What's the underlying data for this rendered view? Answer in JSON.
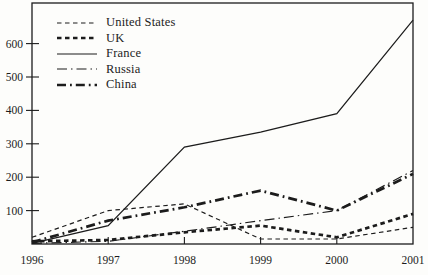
{
  "figure": {
    "background": "#fdfdfb",
    "ink_color": "#1c1c1c"
  },
  "chart_data": {
    "type": "line",
    "title": "",
    "xlabel": "",
    "ylabel": "",
    "grid": false,
    "legend_position": "top-left-inside",
    "x": [
      1996,
      1997,
      1998,
      1999,
      2000,
      2001
    ],
    "x_tick_labels": [
      "1996",
      "1997",
      "1998",
      "1999",
      "2000",
      "2001"
    ],
    "y_ticks": [
      100,
      200,
      300,
      400,
      500,
      600
    ],
    "y_tick_labels": [
      "100",
      "200",
      "300",
      "400",
      "500",
      "600"
    ],
    "ylim": [
      0,
      720
    ],
    "series": [
      {
        "name": "United States",
        "values": [
          20,
          100,
          120,
          15,
          15,
          50
        ],
        "line_style": "thin-dashed",
        "stroke_width": 1.2,
        "dasharray": "4.5,3.5"
      },
      {
        "name": "UK",
        "values": [
          8,
          12,
          35,
          55,
          20,
          90
        ],
        "line_style": "thick-dashed",
        "stroke_width": 2.7,
        "dasharray": "4.5,3.5"
      },
      {
        "name": "France",
        "values": [
          2,
          55,
          290,
          335,
          390,
          670
        ],
        "line_style": "thin-solid",
        "stroke_width": 1.2,
        "dasharray": ""
      },
      {
        "name": "Russia",
        "values": [
          2,
          8,
          38,
          70,
          100,
          220
        ],
        "line_style": "thin-dash-dot",
        "stroke_width": 1.2,
        "dasharray": "10,4,1.5,4"
      },
      {
        "name": "China",
        "values": [
          5,
          70,
          110,
          160,
          100,
          210
        ],
        "line_style": "thick-dash-dot",
        "stroke_width": 2.7,
        "dasharray": "9,4,1.8,4"
      }
    ]
  }
}
